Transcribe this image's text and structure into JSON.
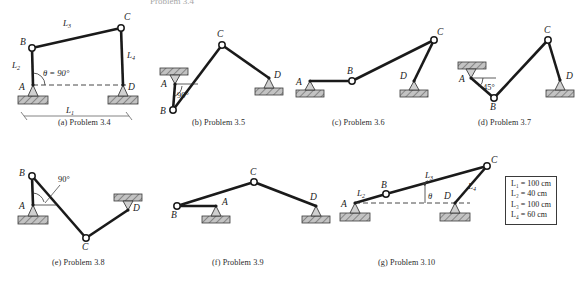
{
  "page": {
    "top_partial_text": "Problem 3.4",
    "background_color": "#ffffff",
    "link_color": "#1a1a1a",
    "ground_fill": "#b9b9b9"
  },
  "legend": {
    "name": "link-lengths-legend",
    "rows": [
      {
        "symbol": "L",
        "sub": "1",
        "eq": "=",
        "value": "100 cm"
      },
      {
        "symbol": "L",
        "sub": "2",
        "eq": "=",
        "value": "40 cm"
      },
      {
        "symbol": "L",
        "sub": "3",
        "eq": "=",
        "value": "100 cm"
      },
      {
        "symbol": "L",
        "sub": "4",
        "eq": "=",
        "value": "60 cm"
      }
    ],
    "line_1": "L₁  =  100 cm",
    "line_2": "L₂  =  40 cm",
    "line_3": "L₃  =  100 cm",
    "line_4": "L₄  =  60 cm"
  },
  "diagrams": [
    {
      "key": "a",
      "caption_letter": "(a)",
      "caption_text": "Problem 3.4",
      "caption_full": "(a) Problem 3.4",
      "joint_labels": [
        "A",
        "B",
        "C",
        "D"
      ],
      "link_labels": [
        "L₂",
        "L₃",
        "L₄",
        "L₁"
      ],
      "angle_label": "θ = 90°",
      "ground_supports": [
        "A",
        "D"
      ]
    },
    {
      "key": "b",
      "caption_letter": "(b)",
      "caption_text": "Problem 3.5",
      "caption_full": "(b) Problem 3.5",
      "joint_labels": [
        "A",
        "B",
        "C",
        "D"
      ],
      "angle_label": "90°",
      "ground_supports": [
        "D"
      ],
      "ceiling_supports": [
        "A"
      ]
    },
    {
      "key": "c",
      "caption_letter": "(c)",
      "caption_text": "Problem 3.6",
      "caption_full": "(c) Problem 3.6",
      "joint_labels": [
        "A",
        "B",
        "C",
        "D"
      ],
      "ground_supports": [
        "A",
        "D"
      ]
    },
    {
      "key": "d",
      "caption_letter": "(d)",
      "caption_text": "Problem 3.7",
      "caption_full": "(d) Problem 3.7",
      "joint_labels": [
        "A",
        "B",
        "C",
        "D"
      ],
      "angle_label": "45°",
      "ground_supports": [
        "D"
      ],
      "ceiling_supports": [
        "A"
      ]
    },
    {
      "key": "e",
      "caption_letter": "(e)",
      "caption_text": "Problem 3.8",
      "caption_full": "(e) Problem 3.8",
      "joint_labels": [
        "A",
        "B",
        "C",
        "D"
      ],
      "angle_label": "90°",
      "ground_supports": [
        "A"
      ],
      "ceiling_supports": [
        "D"
      ]
    },
    {
      "key": "f",
      "caption_letter": "(f)",
      "caption_text": "Problem 3.9",
      "caption_full": "(f) Problem 3.9",
      "joint_labels": [
        "A",
        "B",
        "C",
        "D"
      ],
      "ground_supports": [
        "A",
        "D"
      ]
    },
    {
      "key": "g",
      "caption_letter": "(g)",
      "caption_text": "Problem 3.10",
      "caption_full": "(g) Problem 3.10",
      "joint_labels": [
        "A",
        "B",
        "C",
        "D"
      ],
      "link_labels": [
        "L₂",
        "L₃",
        "L₄"
      ],
      "angle_label": "θ",
      "ground_supports": [
        "A",
        "D"
      ]
    }
  ]
}
